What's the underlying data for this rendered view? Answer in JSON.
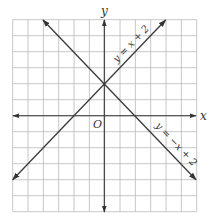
{
  "diagram": {
    "type": "coordinate-graph",
    "grid": {
      "cols": 12,
      "rows": 12,
      "x_range": [
        -6,
        6
      ],
      "y_range": [
        -6,
        6
      ]
    },
    "axes": {
      "x_label": "x",
      "y_label": "y",
      "origin_label": "O"
    },
    "lines": [
      {
        "equation": "y = x + 2",
        "slope": 1,
        "intercept": 2,
        "label": "y = x + 2"
      },
      {
        "equation": "y = -x + 2",
        "slope": -1,
        "intercept": 2,
        "label": "y = −x + 2"
      }
    ],
    "intersection": {
      "x": 0,
      "y": 2
    },
    "colors": {
      "grid": "#b9b9b9",
      "axes": "#333333",
      "lines": "#3a3a3a"
    }
  }
}
